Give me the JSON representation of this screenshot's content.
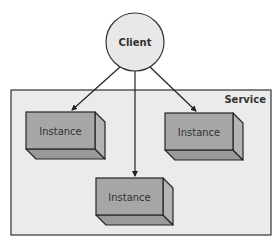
{
  "diagram": {
    "type": "architecture",
    "client": {
      "label": "Client",
      "shape": "circle",
      "cx": 135,
      "cy": 42,
      "r": 29,
      "fill": "#e8e8e8",
      "stroke": "#333333"
    },
    "service": {
      "label": "Service",
      "x": 11,
      "y": 90,
      "width": 260,
      "height": 145,
      "fill": "#ebebeb",
      "stroke": "#333333"
    },
    "instances": [
      {
        "label": "Instance",
        "x": 26,
        "y": 112,
        "width": 69,
        "height": 37
      },
      {
        "label": "Instance",
        "x": 165,
        "y": 113,
        "width": 68,
        "height": 37
      },
      {
        "label": "Instance",
        "x": 96,
        "y": 178,
        "width": 67,
        "height": 37
      }
    ],
    "box_style": {
      "depth": 10,
      "front_fill": "#a6a6a6",
      "side_fill": "#b4b4b4",
      "bottom_fill": "#9a9a9a",
      "stroke": "#262626"
    },
    "edges": [
      {
        "from": "Client",
        "to": "Instance (left)",
        "x1": 120,
        "y1": 67,
        "x2": 72,
        "y2": 110
      },
      {
        "from": "Client",
        "to": "Instance (bottom)",
        "x1": 135,
        "y1": 71,
        "x2": 135,
        "y2": 176
      },
      {
        "from": "Client",
        "to": "Instance (right)",
        "x1": 150,
        "y1": 67,
        "x2": 196,
        "y2": 111
      }
    ]
  }
}
